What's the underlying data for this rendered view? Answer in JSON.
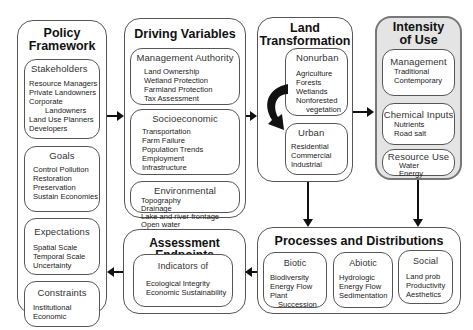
{
  "diagram": {
    "policy": {
      "title_lines": [
        "Policy",
        "Framework"
      ],
      "stakeholders": {
        "title": "Stakeholders",
        "items": [
          "Resource Managers",
          "Private Landowners",
          "Corporate",
          "Landowners",
          "Land Use Planners",
          "Developers"
        ]
      },
      "goals": {
        "title": "Goals",
        "items": [
          "Control Pollution",
          "Restoration",
          "Preservation",
          "Sustain Economies"
        ]
      },
      "expectations": {
        "title": "Expectations",
        "items": [
          "Spatial Scale",
          "Temporal Scale",
          "Uncertainty"
        ]
      },
      "constraints": {
        "title": "Constraints",
        "items": [
          "Institutional",
          "Economic"
        ]
      }
    },
    "driving": {
      "title": "Driving Variables",
      "management": {
        "title": "Management Authority",
        "items": [
          "Land Ownership",
          "Wetland Protection",
          "Farmland Protection",
          "Tax Assessment"
        ]
      },
      "socioeconomic": {
        "title": "Socioeconomic",
        "items": [
          "Transportation",
          "Farm Failure",
          "Population Trends",
          "Employment",
          "Infrastructure"
        ]
      },
      "environmental": {
        "title": "Environmental",
        "items": [
          "Topography",
          "Drainage",
          "Lake and river frontage",
          "Open water"
        ]
      }
    },
    "land": {
      "title_lines": [
        "Land",
        "Transformation"
      ],
      "nonurban": {
        "title": "Nonurban",
        "items": [
          "Agriculture",
          "Forests",
          "Wetlands",
          "Nonforested",
          "vegetation"
        ]
      },
      "urban": {
        "title": "Urban",
        "items": [
          "Residential",
          "Commercial",
          "Industrial"
        ]
      }
    },
    "intensity": {
      "title_lines": [
        "Intensity",
        "of Use"
      ],
      "management": {
        "title": "Management",
        "items": [
          "Traditional",
          "Contemporary"
        ]
      },
      "chemical": {
        "title": "Chemical Inputs",
        "items": [
          "Nutrients",
          "Road salt"
        ]
      },
      "resource": {
        "title": "Resource Use",
        "items": [
          "Water",
          "Energy"
        ]
      }
    },
    "assessment": {
      "title": "Assessment Endpoints",
      "indicators": {
        "title": "Indicators of",
        "items": [
          "Ecological Integrity",
          "Economic Sustainability"
        ]
      }
    },
    "processes": {
      "title": "Processes and Distributions",
      "biotic": {
        "title": "Biotic",
        "items": [
          "Biodiversity",
          "Energy Flow",
          "Plant",
          "Succession"
        ]
      },
      "abiotic": {
        "title": "Abiotic",
        "items": [
          "Hydrologic",
          "Energy Flow",
          "Sedimentation"
        ]
      },
      "social": {
        "title": "Social",
        "items": [
          "Land prob",
          "Productivity",
          "Aesthetics"
        ]
      }
    },
    "colors": {
      "border": "#555555",
      "shaded_fill": "#e4e4e4",
      "arrow": "#111111"
    }
  }
}
